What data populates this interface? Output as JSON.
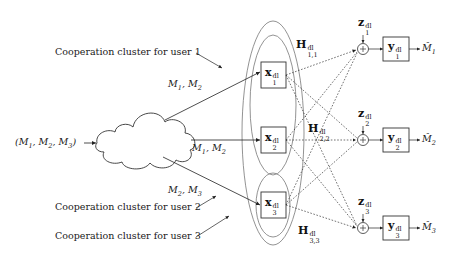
{
  "diagram": {
    "input_label": {
      "text": "(M",
      "items": [
        "M1",
        "M2",
        "M3"
      ],
      "display": "(M1, M2, M3)"
    },
    "cloud_label": "",
    "routes": [
      {
        "label_main": "M",
        "s1": "1",
        "s2": "2",
        "display": "M1, M2"
      },
      {
        "label_main": "M",
        "s1": "1",
        "s2": "2",
        "display": "M1, M2"
      },
      {
        "label_main": "M",
        "s1": "2",
        "s2": "3",
        "display": "M2, M3"
      }
    ],
    "clusters": [
      {
        "label": "Cooperation cluster for user 1"
      },
      {
        "label": "Cooperation cluster for user 2"
      },
      {
        "label": "Cooperation cluster for user 3"
      }
    ],
    "transmitters": [
      {
        "symbol": "x",
        "sup": "dl",
        "sub": "1"
      },
      {
        "symbol": "x",
        "sup": "dl",
        "sub": "2"
      },
      {
        "symbol": "x",
        "sup": "dl",
        "sub": "3"
      }
    ],
    "channels": [
      {
        "symbol": "H",
        "sup": "dl",
        "sub": "1,1"
      },
      {
        "symbol": "H",
        "sup": "dl",
        "sub": "2,2"
      },
      {
        "symbol": "H",
        "sup": "dl",
        "sub": "3,3"
      }
    ],
    "noises": [
      {
        "symbol": "z",
        "sup": "dl",
        "sub": "1"
      },
      {
        "symbol": "z",
        "sup": "dl",
        "sub": "2"
      },
      {
        "symbol": "z",
        "sup": "dl",
        "sub": "3"
      }
    ],
    "receivers": [
      {
        "symbol": "y",
        "sup": "dl",
        "sub": "1"
      },
      {
        "symbol": "y",
        "sup": "dl",
        "sub": "2"
      },
      {
        "symbol": "y",
        "sup": "dl",
        "sub": "3"
      }
    ],
    "outputs": [
      {
        "symbol": "M̂",
        "sub": "1"
      },
      {
        "symbol": "M̂",
        "sub": "2"
      },
      {
        "symbol": "M̂",
        "sub": "3"
      }
    ],
    "adder_symbol": "+",
    "colors": {
      "stroke": "#333333",
      "ellipse": "#666666",
      "text": "#111111"
    }
  }
}
